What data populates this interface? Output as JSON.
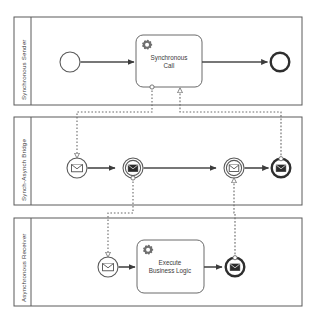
{
  "diagram": {
    "type": "bpmn-collaboration",
    "colors": {
      "stroke": "#5a5a5a",
      "stroke_dark": "#2e2e2e",
      "text": "#3a3a3a",
      "background": "#ffffff",
      "icon": "#6f6f6f"
    },
    "pools": [
      {
        "id": "pool-synchronous-sender",
        "label": "Synchronous Sender",
        "x": 14,
        "y": 17,
        "width": 288,
        "height": 88,
        "header_width": 17,
        "elements": [
          {
            "id": "sender-start",
            "kind": "start-event",
            "label": "",
            "cx": 70,
            "cy": 62,
            "r": 10
          },
          {
            "id": "synchronous-call-task",
            "kind": "service-task",
            "label": "Synchronous Call",
            "x": 136,
            "y": 35,
            "width": 66,
            "height": 52
          },
          {
            "id": "sender-end",
            "kind": "end-event",
            "label": "",
            "cx": 280,
            "cy": 62,
            "r": 10
          }
        ]
      },
      {
        "id": "pool-synch-asynch-bridge",
        "label": "Synch-Asynch Bridge",
        "x": 14,
        "y": 117,
        "width": 288,
        "height": 88,
        "header_width": 17,
        "elements": [
          {
            "id": "bridge-start-message",
            "kind": "message-start-event",
            "label": "",
            "cx": 77,
            "cy": 168,
            "r": 10
          },
          {
            "id": "bridge-throw-message-1",
            "kind": "message-intermediate-throw-event",
            "label": "",
            "cx": 133,
            "cy": 168,
            "r": 10
          },
          {
            "id": "bridge-catch-message",
            "kind": "message-intermediate-catch-event",
            "label": "",
            "cx": 234,
            "cy": 168,
            "r": 10
          },
          {
            "id": "bridge-end-message",
            "kind": "message-end-event",
            "label": "",
            "cx": 281,
            "cy": 168,
            "r": 10
          }
        ]
      },
      {
        "id": "pool-asynchronous-receiver",
        "label": "Asynchronous Receiver",
        "x": 14,
        "y": 218,
        "width": 288,
        "height": 88,
        "header_width": 17,
        "elements": [
          {
            "id": "receiver-start-message",
            "kind": "message-start-event",
            "label": "",
            "cx": 108,
            "cy": 267,
            "r": 10
          },
          {
            "id": "execute-business-logic-task",
            "kind": "service-task",
            "label": "Execute Business Logic",
            "x": 137,
            "y": 240,
            "width": 67,
            "height": 53
          },
          {
            "id": "receiver-end-message",
            "kind": "message-end-event",
            "label": "",
            "cx": 235,
            "cy": 267,
            "r": 10
          }
        ]
      }
    ],
    "task_labels": {
      "synchronous_call_line1": "Synchronous",
      "synchronous_call_line2": "Call",
      "execute_business_logic_line1": "Execute",
      "execute_business_logic_line2": "Business Logic"
    },
    "sequence_flows": [
      {
        "id": "flow-sender-start-to-call",
        "from": "sender-start",
        "to": "synchronous-call-task"
      },
      {
        "id": "flow-call-to-sender-end",
        "from": "synchronous-call-task",
        "to": "sender-end"
      },
      {
        "id": "flow-bridge-start-to-throw",
        "from": "bridge-start-message",
        "to": "bridge-throw-message-1"
      },
      {
        "id": "flow-bridge-throw-to-catch",
        "from": "bridge-throw-message-1",
        "to": "bridge-catch-message"
      },
      {
        "id": "flow-bridge-catch-to-end",
        "from": "bridge-catch-message",
        "to": "bridge-end-message"
      },
      {
        "id": "flow-receiver-start-to-task",
        "from": "receiver-start-message",
        "to": "execute-business-logic-task"
      },
      {
        "id": "flow-receiver-task-to-end",
        "from": "execute-business-logic-task",
        "to": "receiver-end-message"
      }
    ],
    "message_flows": [
      {
        "id": "msgflow-call-to-bridge-start",
        "from": "synchronous-call-task",
        "to": "bridge-start-message"
      },
      {
        "id": "msgflow-bridge-end-to-call",
        "from": "bridge-end-message",
        "to": "synchronous-call-task"
      },
      {
        "id": "msgflow-bridge-throw-to-receiver-start",
        "from": "bridge-throw-message-1",
        "to": "receiver-start-message"
      },
      {
        "id": "msgflow-receiver-end-to-bridge-catch",
        "from": "receiver-end-message",
        "to": "bridge-catch-message"
      }
    ]
  }
}
